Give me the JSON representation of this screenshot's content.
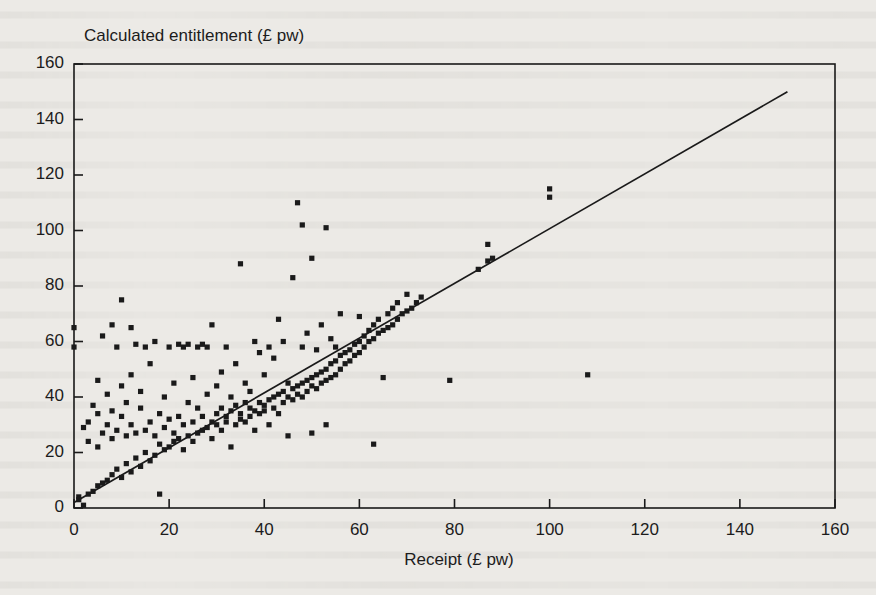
{
  "chart_data": {
    "type": "scatter",
    "title": "",
    "xlabel": "Receipt (£ pw)",
    "ylabel": "Calculated entitlement (£ pw)",
    "xlim": [
      0,
      160
    ],
    "ylim": [
      0,
      160
    ],
    "xticks": [
      0,
      20,
      40,
      60,
      80,
      100,
      120,
      140,
      160
    ],
    "yticks": [
      0,
      20,
      40,
      60,
      80,
      100,
      120,
      140,
      160
    ],
    "grid": false,
    "legend": "none",
    "marker": "filled-square",
    "marker_color": "#1a1a1a",
    "reference_line": {
      "label": "y = x identity line",
      "x": [
        0,
        150
      ],
      "y": [
        2,
        150
      ],
      "color": "#1a1a1a"
    },
    "points": [
      [
        0,
        58
      ],
      [
        0,
        65
      ],
      [
        1,
        3
      ],
      [
        1,
        4
      ],
      [
        2,
        1
      ],
      [
        2,
        29
      ],
      [
        3,
        5
      ],
      [
        3,
        24
      ],
      [
        3,
        31
      ],
      [
        4,
        6
      ],
      [
        4,
        37
      ],
      [
        5,
        8
      ],
      [
        5,
        22
      ],
      [
        5,
        34
      ],
      [
        5,
        46
      ],
      [
        6,
        9
      ],
      [
        6,
        27
      ],
      [
        6,
        62
      ],
      [
        7,
        10
      ],
      [
        7,
        30
      ],
      [
        7,
        41
      ],
      [
        8,
        12
      ],
      [
        8,
        25
      ],
      [
        8,
        35
      ],
      [
        8,
        66
      ],
      [
        9,
        14
      ],
      [
        9,
        28
      ],
      [
        9,
        58
      ],
      [
        10,
        11
      ],
      [
        10,
        33
      ],
      [
        10,
        44
      ],
      [
        10,
        75
      ],
      [
        11,
        16
      ],
      [
        11,
        26
      ],
      [
        11,
        38
      ],
      [
        12,
        13
      ],
      [
        12,
        30
      ],
      [
        12,
        48
      ],
      [
        12,
        65
      ],
      [
        13,
        18
      ],
      [
        13,
        27
      ],
      [
        13,
        59
      ],
      [
        14,
        15
      ],
      [
        14,
        36
      ],
      [
        14,
        42
      ],
      [
        15,
        20
      ],
      [
        15,
        28
      ],
      [
        15,
        58
      ],
      [
        16,
        17
      ],
      [
        16,
        31
      ],
      [
        16,
        52
      ],
      [
        17,
        19
      ],
      [
        17,
        26
      ],
      [
        17,
        60
      ],
      [
        18,
        23
      ],
      [
        18,
        34
      ],
      [
        18,
        5
      ],
      [
        19,
        21
      ],
      [
        19,
        29
      ],
      [
        19,
        40
      ],
      [
        20,
        22
      ],
      [
        20,
        32
      ],
      [
        20,
        58
      ],
      [
        21,
        24
      ],
      [
        21,
        27
      ],
      [
        21,
        45
      ],
      [
        22,
        25
      ],
      [
        22,
        33
      ],
      [
        22,
        59
      ],
      [
        23,
        21
      ],
      [
        23,
        30
      ],
      [
        23,
        58
      ],
      [
        24,
        26
      ],
      [
        24,
        38
      ],
      [
        24,
        59
      ],
      [
        25,
        24
      ],
      [
        25,
        31
      ],
      [
        25,
        47
      ],
      [
        26,
        27
      ],
      [
        26,
        36
      ],
      [
        26,
        58
      ],
      [
        27,
        28
      ],
      [
        27,
        33
      ],
      [
        27,
        59
      ],
      [
        28,
        29
      ],
      [
        28,
        41
      ],
      [
        28,
        58
      ],
      [
        29,
        25
      ],
      [
        29,
        31
      ],
      [
        29,
        66
      ],
      [
        30,
        30
      ],
      [
        30,
        34
      ],
      [
        30,
        44
      ],
      [
        31,
        28
      ],
      [
        31,
        36
      ],
      [
        31,
        49
      ],
      [
        32,
        31
      ],
      [
        32,
        33
      ],
      [
        32,
        58
      ],
      [
        33,
        22
      ],
      [
        33,
        35
      ],
      [
        33,
        40
      ],
      [
        34,
        30
      ],
      [
        34,
        37
      ],
      [
        34,
        52
      ],
      [
        35,
        32
      ],
      [
        35,
        34
      ],
      [
        35,
        88
      ],
      [
        36,
        31
      ],
      [
        36,
        38
      ],
      [
        36,
        45
      ],
      [
        37,
        33
      ],
      [
        37,
        36
      ],
      [
        37,
        42
      ],
      [
        38,
        28
      ],
      [
        38,
        35
      ],
      [
        38,
        60
      ],
      [
        39,
        34
      ],
      [
        39,
        38
      ],
      [
        39,
        56
      ],
      [
        40,
        35
      ],
      [
        40,
        37
      ],
      [
        40,
        48
      ],
      [
        41,
        30
      ],
      [
        41,
        39
      ],
      [
        41,
        58
      ],
      [
        42,
        36
      ],
      [
        42,
        40
      ],
      [
        42,
        54
      ],
      [
        43,
        34
      ],
      [
        43,
        41
      ],
      [
        43,
        68
      ],
      [
        44,
        38
      ],
      [
        44,
        42
      ],
      [
        44,
        60
      ],
      [
        45,
        26
      ],
      [
        45,
        40
      ],
      [
        45,
        45
      ],
      [
        46,
        39
      ],
      [
        46,
        43
      ],
      [
        46,
        83
      ],
      [
        47,
        41
      ],
      [
        47,
        44
      ],
      [
        47,
        110
      ],
      [
        48,
        40
      ],
      [
        48,
        45
      ],
      [
        48,
        58
      ],
      [
        48,
        102
      ],
      [
        49,
        42
      ],
      [
        49,
        46
      ],
      [
        49,
        63
      ],
      [
        50,
        27
      ],
      [
        50,
        44
      ],
      [
        50,
        47
      ],
      [
        50,
        90
      ],
      [
        51,
        43
      ],
      [
        51,
        48
      ],
      [
        51,
        57
      ],
      [
        52,
        45
      ],
      [
        52,
        49
      ],
      [
        52,
        66
      ],
      [
        53,
        30
      ],
      [
        53,
        46
      ],
      [
        53,
        50
      ],
      [
        53,
        101
      ],
      [
        54,
        47
      ],
      [
        54,
        52
      ],
      [
        54,
        61
      ],
      [
        55,
        48
      ],
      [
        55,
        53
      ],
      [
        55,
        58
      ],
      [
        56,
        50
      ],
      [
        56,
        55
      ],
      [
        56,
        70
      ],
      [
        57,
        52
      ],
      [
        57,
        56
      ],
      [
        58,
        53
      ],
      [
        58,
        57
      ],
      [
        59,
        55
      ],
      [
        59,
        59
      ],
      [
        60,
        56
      ],
      [
        60,
        60
      ],
      [
        60,
        69
      ],
      [
        61,
        58
      ],
      [
        61,
        62
      ],
      [
        62,
        60
      ],
      [
        62,
        64
      ],
      [
        63,
        23
      ],
      [
        63,
        61
      ],
      [
        63,
        66
      ],
      [
        64,
        63
      ],
      [
        64,
        68
      ],
      [
        65,
        64
      ],
      [
        65,
        47
      ],
      [
        66,
        65
      ],
      [
        66,
        70
      ],
      [
        67,
        66
      ],
      [
        67,
        72
      ],
      [
        68,
        68
      ],
      [
        68,
        74
      ],
      [
        69,
        70
      ],
      [
        70,
        71
      ],
      [
        70,
        77
      ],
      [
        71,
        72
      ],
      [
        72,
        74
      ],
      [
        73,
        76
      ],
      [
        79,
        46
      ],
      [
        85,
        86
      ],
      [
        87,
        89
      ],
      [
        87,
        95
      ],
      [
        88,
        90
      ],
      [
        100,
        112
      ],
      [
        100,
        115
      ],
      [
        108,
        48
      ]
    ]
  },
  "axis": {
    "x_tick_labels": [
      "0",
      "20",
      "40",
      "60",
      "80",
      "100",
      "120",
      "140",
      "160"
    ],
    "y_tick_labels": [
      "0",
      "20",
      "40",
      "60",
      "80",
      "100",
      "120",
      "140",
      "160"
    ]
  }
}
